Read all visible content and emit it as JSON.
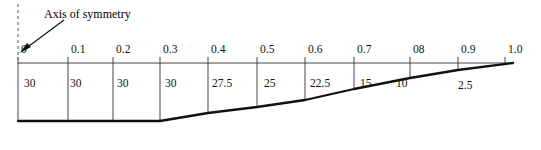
{
  "figure": {
    "annotation": {
      "axis_label": "Axis of symmetry",
      "axis_label_x": 44,
      "axis_label_y": 8,
      "arrow_icon": "arrow-down-left-icon",
      "dashed_line_icon": "dashed-vertical-line-icon"
    },
    "axis": {
      "origin_x": 18,
      "end_x": 513,
      "baseline_y": 63,
      "tick_top_y": 57,
      "tick_bottom_y": 70,
      "ticks": [
        {
          "label": "0",
          "x": 18,
          "value": 0.0
        },
        {
          "label": "0.1",
          "x": 68,
          "value": 0.1
        },
        {
          "label": "0.2",
          "x": 113,
          "value": 0.2
        },
        {
          "label": "0.3",
          "x": 160,
          "value": 0.3
        },
        {
          "label": "0.4",
          "x": 208,
          "value": 0.4
        },
        {
          "label": "0.5",
          "x": 257,
          "value": 0.5
        },
        {
          "label": "0.6",
          "x": 305,
          "value": 0.6
        },
        {
          "label": "0.7",
          "x": 354,
          "value": 0.7
        },
        {
          "label": "08",
          "x": 410,
          "value": 0.8
        },
        {
          "label": "0.9",
          "x": 458,
          "value": 0.9
        },
        {
          "label": "1.0",
          "x": 505,
          "value": 1.0
        }
      ]
    },
    "cells": [
      {
        "label": "30",
        "x": 24,
        "y": 78,
        "value": 30
      },
      {
        "label": "30",
        "x": 70,
        "y": 78,
        "value": 30
      },
      {
        "label": "30",
        "x": 117,
        "y": 78,
        "value": 30
      },
      {
        "label": "30",
        "x": 165,
        "y": 78,
        "value": 30
      },
      {
        "label": "27.5",
        "x": 212,
        "y": 78,
        "value": 27.5
      },
      {
        "label": "25",
        "x": 264,
        "y": 78,
        "value": 25
      },
      {
        "label": "22.5",
        "x": 310,
        "y": 78,
        "value": 22.5
      },
      {
        "label": "15",
        "x": 360,
        "y": 78,
        "value": 15
      },
      {
        "label": "10",
        "x": 396,
        "y": 78,
        "value": 10
      },
      {
        "label": "2.5",
        "x": 458,
        "y": 80,
        "value": 2.5
      }
    ],
    "dividers_x": [
      18,
      68,
      113,
      160,
      208,
      257,
      305,
      354,
      410,
      458
    ],
    "profile_points": [
      {
        "x": 18,
        "y": 121
      },
      {
        "x": 160,
        "y": 121
      },
      {
        "x": 208,
        "y": 113
      },
      {
        "x": 257,
        "y": 107
      },
      {
        "x": 305,
        "y": 100
      },
      {
        "x": 354,
        "y": 89
      },
      {
        "x": 410,
        "y": 78
      },
      {
        "x": 458,
        "y": 70
      },
      {
        "x": 513,
        "y": 63
      }
    ],
    "colors": {
      "line": "#1a1a1a",
      "grid": "#555555",
      "background": "#ffffff"
    }
  }
}
